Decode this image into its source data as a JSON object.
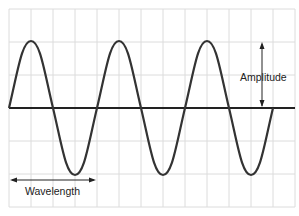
{
  "diagram": {
    "type": "sine-wave",
    "labels": {
      "amplitude": "Amplitude",
      "wavelength": "Wavelength"
    },
    "grid": {
      "columns": 13,
      "rows": 6,
      "line_color": "#dcdcdc",
      "background": "#ffffff"
    },
    "wave": {
      "cycles": 3,
      "color": "#333333"
    },
    "axis_color": "#222222"
  }
}
